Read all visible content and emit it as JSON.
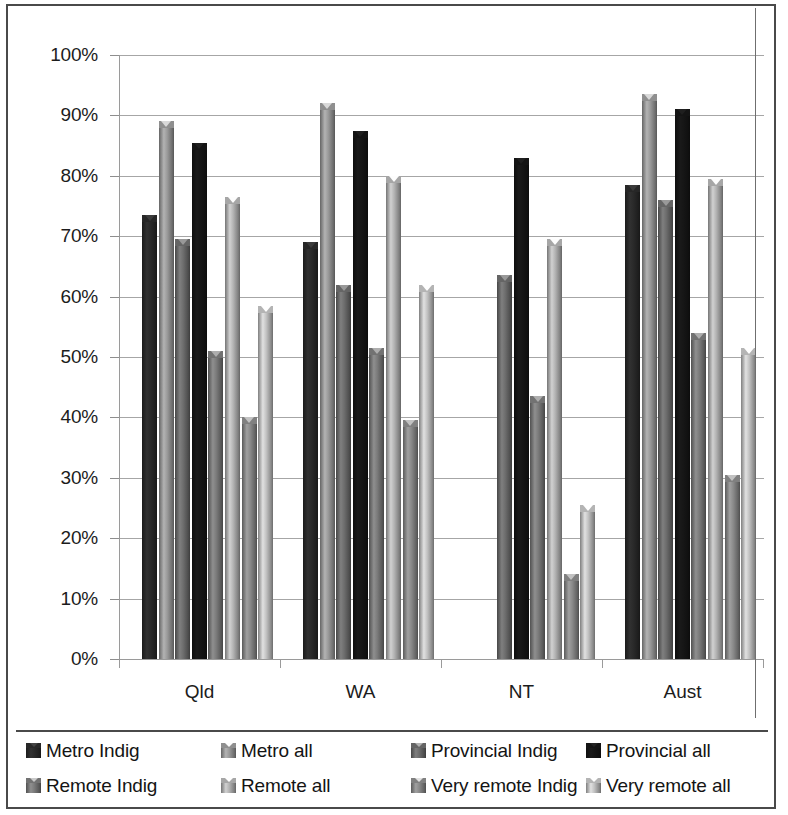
{
  "chart_data": {
    "type": "bar",
    "title": "",
    "subtitle": "",
    "xlabel": "",
    "ylabel": "",
    "ylim": [
      0,
      100
    ],
    "grid": true,
    "legend_position": "bottom",
    "y_tick_labels": [
      "0%",
      "10%",
      "20%",
      "30%",
      "40%",
      "50%",
      "60%",
      "70%",
      "80%",
      "90%",
      "100%"
    ],
    "y_ticks": [
      0,
      10,
      20,
      30,
      40,
      50,
      60,
      70,
      80,
      90,
      100
    ],
    "categories": [
      "Qld",
      "WA",
      "NT",
      "Aust"
    ],
    "series": [
      {
        "name": "Metro Indig",
        "values": [
          73.5,
          69.0,
          null,
          78.5
        ],
        "color": "#262626"
      },
      {
        "name": "Metro all",
        "values": [
          89.0,
          92.0,
          null,
          93.5
        ],
        "color": "#8c8c8c"
      },
      {
        "name": "Provincial Indig",
        "values": [
          69.5,
          62.0,
          63.5,
          76.0
        ],
        "color": "#636363"
      },
      {
        "name": "Provincial all",
        "values": [
          85.5,
          87.5,
          83.0,
          91.0
        ],
        "color": "#141414"
      },
      {
        "name": "Remote Indig",
        "values": [
          51.0,
          51.5,
          43.5,
          54.0
        ],
        "color": "#707070"
      },
      {
        "name": "Remote all",
        "values": [
          76.5,
          80.0,
          69.5,
          79.5
        ],
        "color": "#a3a3a3"
      },
      {
        "name": "Very remote Indig",
        "values": [
          40.0,
          39.5,
          14.0,
          30.5
        ],
        "color": "#7d7d7d"
      },
      {
        "name": "Very remote all",
        "values": [
          58.5,
          62.0,
          25.5,
          51.5
        ],
        "color": "#b0b0b0"
      }
    ]
  },
  "legend": {
    "rows": [
      [
        "Metro Indig",
        "Metro all",
        "Provincial Indig",
        "Provincial all"
      ],
      [
        "Remote Indig",
        "Remote all",
        "Very remote Indig",
        "Very remote all"
      ]
    ]
  },
  "colors": {
    "frame": "#4a4a4a",
    "gridline": "#a6a6a6",
    "axis": "#9a9a9a",
    "text": "#1c1c1c",
    "background": "#ffffff"
  }
}
